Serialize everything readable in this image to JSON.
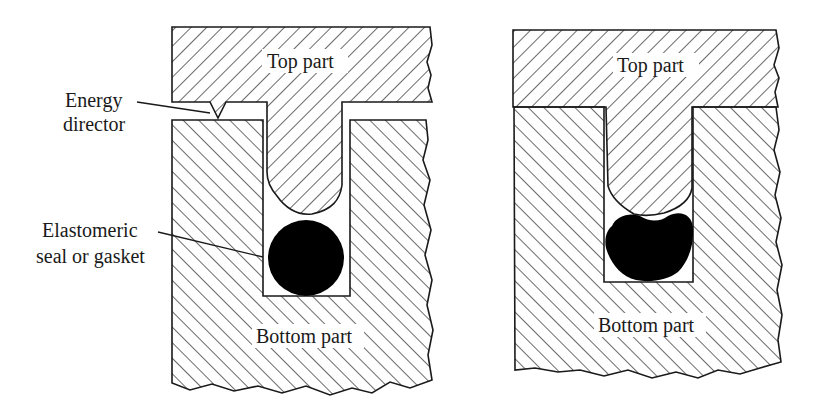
{
  "figure": {
    "panels": [
      {
        "id": "before",
        "top_label": "Top part",
        "bottom_label": "Bottom part",
        "callouts": [
          {
            "lines": [
              "Energy",
              "director"
            ]
          },
          {
            "lines": [
              "Elastomeric",
              "seal or gasket"
            ]
          }
        ]
      },
      {
        "id": "after",
        "top_label": "Top part",
        "bottom_label": "Bottom part"
      }
    ],
    "colors": {
      "line": "#1a1a1a",
      "seal": "#000000",
      "background": "#ffffff"
    }
  }
}
